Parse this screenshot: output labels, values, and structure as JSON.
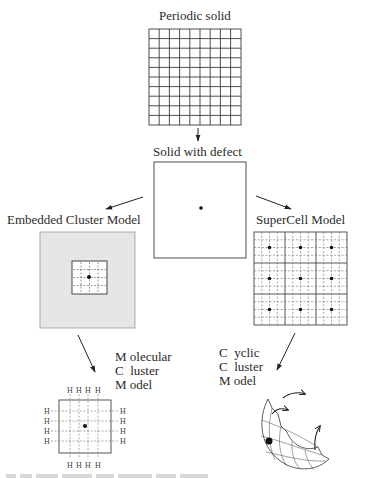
{
  "diagram": {
    "nodes": {
      "periodic": {
        "label": "Periodic solid"
      },
      "defect": {
        "label": "Solid with defect"
      },
      "embedded": {
        "label": "Embedded Cluster Model"
      },
      "supercell": {
        "label": "SuperCell Model"
      },
      "molecular": {
        "label_lines": [
          "M olecular",
          "C  luster",
          "M odel"
        ]
      },
      "cyclic": {
        "label_lines": [
          "C  yclic",
          "C  luster",
          "M odel"
        ]
      }
    },
    "hydrogen_label": "H",
    "edges": [
      {
        "from": "periodic",
        "to": "defect"
      },
      {
        "from": "defect",
        "to": "embedded"
      },
      {
        "from": "defect",
        "to": "supercell"
      },
      {
        "from": "embedded",
        "to": "molecular"
      },
      {
        "from": "supercell",
        "to": "cyclic"
      }
    ],
    "colors": {
      "line": "#3a3a3a",
      "embedded_fill": "#e6e6e6",
      "dashed": "#666666",
      "defect_dot": "#111111"
    }
  }
}
